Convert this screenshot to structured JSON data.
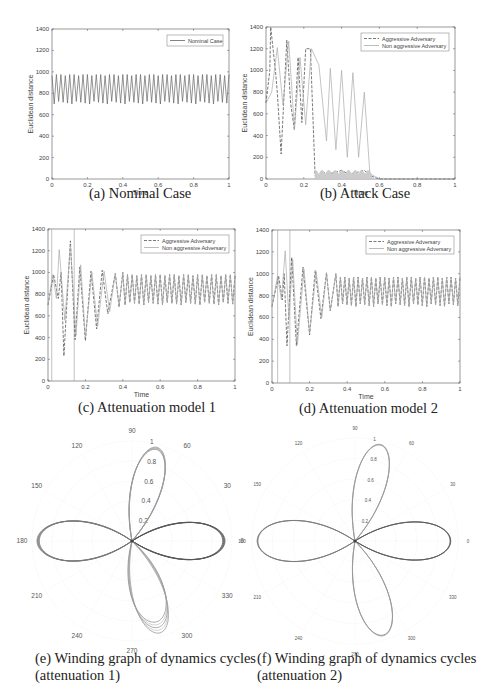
{
  "figure": {
    "captions": {
      "a": "(a) Nominal Case",
      "b": "(b) Attack Case",
      "c": "(c) Attenuation model 1",
      "d": "(d) Attenuation model 2",
      "e_line1": "(e) Winding graph of dynamics cycles",
      "e_line2": "(attenuation 1)",
      "f_line1": "(f) Winding graph of dynamics cycles",
      "f_line2": "(attenuation 2)"
    }
  },
  "chart_data": [
    {
      "id": "a",
      "type": "line",
      "title": "(a) Nominal Case",
      "xlabel": "Time",
      "ylabel": "Euclidean distance",
      "xlim": [
        0,
        1
      ],
      "ylim": [
        0,
        1400
      ],
      "xticks": [
        "0",
        "0.2",
        "0.4",
        "0.6",
        "0.8",
        "1"
      ],
      "yticks": [
        "0",
        "200",
        "400",
        "600",
        "800",
        "1000",
        "1200",
        "1400"
      ],
      "legend": [
        "Nominal Case"
      ],
      "legend_position": "upper right",
      "series": [
        {
          "name": "Nominal Case",
          "style": "solid",
          "description": "steady oscillation ~40 cycles",
          "cycles": 40,
          "min": 700,
          "max": 975
        }
      ]
    },
    {
      "id": "b",
      "type": "line",
      "title": "(b) Attack Case",
      "xlabel": "Time",
      "ylabel": "Euclidean distance",
      "xlim": [
        0,
        1
      ],
      "ylim": [
        0,
        1400
      ],
      "xticks": [
        "0",
        "0.2",
        "0.4",
        "0.6",
        "0.8",
        "1"
      ],
      "yticks": [
        "0",
        "200",
        "400",
        "600",
        "800",
        "1000",
        "1200",
        "1400"
      ],
      "legend": [
        "Aggressive Adversary",
        "Non aggressive Adversary"
      ],
      "legend_position": "upper right",
      "series": [
        {
          "name": "Aggressive Adversary",
          "style": "dashed",
          "x": [
            0,
            0.02,
            0.025,
            0.05,
            0.06,
            0.08,
            0.11,
            0.13,
            0.15,
            0.17,
            0.19,
            0.21,
            0.235,
            0.26,
            0.27,
            0.3,
            0.34,
            0.4,
            0.44,
            0.48,
            0.52,
            0.55,
            0.6,
            1.0
          ],
          "y": [
            700,
            1000,
            1400,
            1000,
            800,
            230,
            1280,
            700,
            450,
            1120,
            520,
            1200,
            1200,
            30,
            20,
            60,
            50,
            80,
            40,
            60,
            80,
            30,
            0,
            0
          ]
        },
        {
          "name": "Non aggressive Adversary",
          "style": "solid",
          "x": [
            0,
            0.03,
            0.06,
            0.09,
            0.12,
            0.15,
            0.18,
            0.21,
            0.24,
            0.28,
            0.32,
            0.34,
            0.37,
            0.4,
            0.43,
            0.46,
            0.49,
            0.52,
            0.55,
            0.6,
            1.0
          ],
          "y": [
            700,
            800,
            1210,
            680,
            1270,
            460,
            1120,
            500,
            1200,
            1050,
            350,
            1020,
            270,
            1000,
            200,
            980,
            200,
            800,
            50,
            0,
            0
          ]
        }
      ]
    },
    {
      "id": "c",
      "type": "line",
      "title": "(c) Attenuation model 1",
      "xlabel": "Time",
      "ylabel": "Euclidean distance",
      "xlim": [
        0,
        1
      ],
      "ylim": [
        0,
        1400
      ],
      "xticks": [
        "0",
        "0.2",
        "0.4",
        "0.6",
        "0.8",
        "1"
      ],
      "yticks": [
        "0",
        "200",
        "400",
        "600",
        "800",
        "1000",
        "1200",
        "1400"
      ],
      "legend": [
        "Aggressive Adversary",
        "Non aggressive Adversary"
      ],
      "legend_position": "upper right",
      "vlines": [
        0.02,
        0.14
      ],
      "series": [
        {
          "name": "Aggressive Adversary",
          "style": "dashed",
          "peaks": [
            [
              0.0,
              700
            ],
            [
              0.03,
              980
            ],
            [
              0.055,
              760
            ],
            [
              0.07,
              1000
            ],
            [
              0.085,
              230
            ],
            [
              0.12,
              1290
            ],
            [
              0.145,
              380
            ],
            [
              0.17,
              1050
            ],
            [
              0.2,
              370
            ],
            [
              0.23,
              1010
            ],
            [
              0.26,
              480
            ],
            [
              0.29,
              1020
            ],
            [
              0.32,
              620
            ],
            [
              0.36,
              990
            ],
            [
              0.38,
              680
            ],
            [
              0.4,
              1000
            ]
          ],
          "steady": {
            "from": 0.4,
            "cycles": 24,
            "min": 700,
            "max": 980
          }
        },
        {
          "name": "Non aggressive Adversary",
          "style": "solid",
          "peaks": [
            [
              0.0,
              700
            ],
            [
              0.025,
              980
            ],
            [
              0.045,
              760
            ],
            [
              0.06,
              1210
            ],
            [
              0.09,
              560
            ],
            [
              0.12,
              1250
            ],
            [
              0.15,
              420
            ],
            [
              0.175,
              1070
            ],
            [
              0.2,
              400
            ],
            [
              0.235,
              1000
            ],
            [
              0.265,
              500
            ],
            [
              0.3,
              1010
            ],
            [
              0.33,
              640
            ],
            [
              0.36,
              990
            ],
            [
              0.38,
              690
            ],
            [
              0.4,
              1000
            ]
          ],
          "steady": {
            "from": 0.4,
            "cycles": 24,
            "min": 700,
            "max": 980
          }
        }
      ]
    },
    {
      "id": "d",
      "type": "line",
      "title": "(d) Attenuation model 2",
      "xlabel": "Time",
      "ylabel": "Euclidean distance",
      "xlim": [
        0,
        1
      ],
      "ylim": [
        0,
        1400
      ],
      "xticks": [
        "0",
        "0.2",
        "0.4",
        "0.6",
        "0.8",
        "1"
      ],
      "yticks": [
        "0",
        "200",
        "400",
        "600",
        "800",
        "1000",
        "1200",
        "1400"
      ],
      "legend": [
        "Aggressive Adversary",
        "Non aggressive Adversary"
      ],
      "legend_position": "upper right",
      "vlines": [
        0.03,
        0.095
      ],
      "series": [
        {
          "name": "Aggressive Adversary",
          "style": "dashed",
          "peaks": [
            [
              0.0,
              700
            ],
            [
              0.035,
              980
            ],
            [
              0.055,
              760
            ],
            [
              0.065,
              1000
            ],
            [
              0.08,
              340
            ],
            [
              0.105,
              1150
            ],
            [
              0.13,
              340
            ],
            [
              0.165,
              1060
            ],
            [
              0.2,
              440
            ],
            [
              0.23,
              1030
            ],
            [
              0.26,
              590
            ],
            [
              0.29,
              1010
            ],
            [
              0.31,
              660
            ],
            [
              0.34,
              1000
            ]
          ],
          "steady": {
            "from": 0.34,
            "cycles": 28,
            "min": 700,
            "max": 970
          }
        },
        {
          "name": "Non aggressive Adversary",
          "style": "solid",
          "peaks": [
            [
              0.0,
              700
            ],
            [
              0.03,
              980
            ],
            [
              0.05,
              760
            ],
            [
              0.07,
              1210
            ],
            [
              0.09,
              590
            ],
            [
              0.11,
              1130
            ],
            [
              0.135,
              350
            ],
            [
              0.17,
              1040
            ],
            [
              0.2,
              450
            ],
            [
              0.235,
              1020
            ],
            [
              0.265,
              600
            ],
            [
              0.29,
              1000
            ],
            [
              0.31,
              660
            ],
            [
              0.34,
              1000
            ]
          ],
          "steady": {
            "from": 0.34,
            "cycles": 28,
            "min": 700,
            "max": 970
          }
        }
      ]
    },
    {
      "id": "e",
      "type": "polar",
      "title": "(e) Winding graph of dynamics cycles (attenuation 1)",
      "angle_ticks": [
        "0",
        "30",
        "60",
        "90",
        "120",
        "150",
        "180",
        "210",
        "240",
        "270",
        "300",
        "330"
      ],
      "radial_ticks": [
        "0.2",
        "0.4",
        "0.6",
        "0.8",
        "1"
      ],
      "rlim": [
        0,
        1
      ],
      "description": "three-lobed rose curve with lobes at ~0°, ~75°, ~180°, ~285°; extra transient traces in the lower lobe",
      "lobes": [
        {
          "angle": 0,
          "r": 0.93,
          "width": 0.36
        },
        {
          "angle": 75,
          "r": 0.97,
          "width": 0.28
        },
        {
          "angle": 180,
          "r": 0.95,
          "width": 0.38
        },
        {
          "angle": 287,
          "r": 0.96,
          "width": 0.3
        }
      ]
    },
    {
      "id": "f",
      "type": "polar",
      "title": "(f) Winding graph of dynamics cycles (attenuation 2)",
      "angle_ticks": [
        "0",
        "30",
        "60",
        "90",
        "120",
        "150",
        "180",
        "210",
        "240",
        "270",
        "300",
        "330"
      ],
      "radial_ticks": [
        "0.2",
        "0.4",
        "0.6",
        "0.8",
        "1"
      ],
      "rlim": [
        0,
        1
      ],
      "description": "clean four-lobed rose curve with lobes at ~0°, ~75°, ~180°, ~285°",
      "lobes": [
        {
          "angle": 0,
          "r": 0.93,
          "width": 0.36
        },
        {
          "angle": 75,
          "r": 0.97,
          "width": 0.28
        },
        {
          "angle": 180,
          "r": 0.95,
          "width": 0.38
        },
        {
          "angle": 287,
          "r": 0.96,
          "width": 0.3
        }
      ]
    }
  ]
}
